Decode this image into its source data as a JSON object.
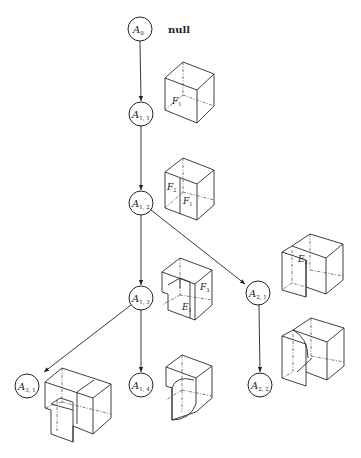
{
  "diagram": {
    "type": "search-tree",
    "root_annotation": "null",
    "nodes": [
      {
        "id": "A0",
        "base": "A",
        "sub": "0",
        "x": 140,
        "y": 29
      },
      {
        "id": "A1,1",
        "base": "A",
        "sub": "1, 1",
        "x": 141,
        "y": 114
      },
      {
        "id": "A1,2",
        "base": "A",
        "sub": "1, 2",
        "x": 141,
        "y": 203
      },
      {
        "id": "A1,3",
        "base": "A",
        "sub": "1, 3",
        "x": 141,
        "y": 298
      },
      {
        "id": "A2,1",
        "base": "A",
        "sub": "2, 1",
        "x": 258,
        "y": 293
      },
      {
        "id": "A1,4",
        "base": "A",
        "sub": "1, 4",
        "x": 141,
        "y": 385
      },
      {
        "id": "A2,2",
        "base": "A",
        "sub": "2, 2",
        "x": 260,
        "y": 385
      },
      {
        "id": "A3,1",
        "base": "A",
        "sub": "3, 1",
        "x": 27,
        "y": 386
      }
    ],
    "edges": [
      {
        "from": "A0",
        "to": "A1,1"
      },
      {
        "from": "A1,1",
        "to": "A1,2"
      },
      {
        "from": "A1,2",
        "to": "A1,3"
      },
      {
        "from": "A1,2",
        "to": "A2,1"
      },
      {
        "from": "A1,3",
        "to": "A1,4"
      },
      {
        "from": "A1,3",
        "to": "A3,1"
      },
      {
        "from": "A2,1",
        "to": "A2,2"
      }
    ],
    "face_labels": [
      {
        "node": "A1,1",
        "base": "F",
        "sub": "1"
      },
      {
        "node": "A1,2",
        "base": "F",
        "sub": "2"
      },
      {
        "node": "A1,2",
        "base": "F",
        "sub": "1"
      },
      {
        "node": "A1,3",
        "base": "F",
        "sub": "3"
      },
      {
        "node": "A1,3",
        "base": "E",
        "sub": "1"
      },
      {
        "node": "A2,1",
        "base": "E",
        "sub": "2"
      }
    ]
  }
}
